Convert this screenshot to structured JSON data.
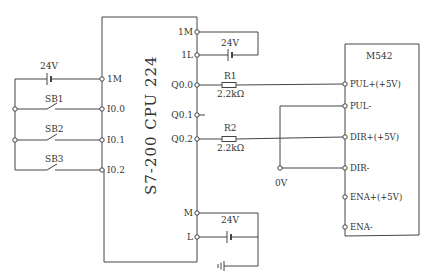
{
  "diagram": {
    "type": "wiring-schematic",
    "plc": {
      "title": "S7-200 CPU 224",
      "left_terminals": [
        "1M",
        "I0.0",
        "I0.1",
        "I0.2"
      ],
      "right_terminals": [
        "1M",
        "1L",
        "Q0.0",
        "Q0.1",
        "Q0.2",
        "M",
        "L"
      ]
    },
    "driver": {
      "title": "M542",
      "terminals": [
        "PUL+(+5V)",
        "PUL-",
        "DIR+(+5V)",
        "DIR-",
        "ENA+(+5V)",
        "ENA-"
      ]
    },
    "switches": [
      "SB1",
      "SB2",
      "SB3"
    ],
    "supplies": {
      "input_supply": "24V",
      "output_supply": "24V",
      "plc_power": "24V"
    },
    "resistors": [
      {
        "name": "R1",
        "value": "2.2kΩ"
      },
      {
        "name": "R2",
        "value": "2.2kΩ"
      }
    ],
    "common_node": "0V"
  }
}
